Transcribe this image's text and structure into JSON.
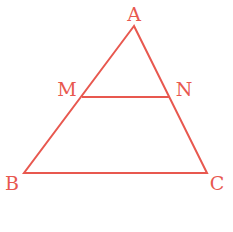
{
  "diagram": {
    "stroke_color": "#e8584f",
    "points": {
      "A": {
        "label": "A",
        "x": 134,
        "y": 26,
        "label_x": 134,
        "label_y": 21
      },
      "B": {
        "label": "B",
        "x": 24,
        "y": 173,
        "label_x": 12,
        "label_y": 190
      },
      "C": {
        "label": "C",
        "x": 207,
        "y": 173,
        "label_x": 217,
        "label_y": 190
      },
      "M": {
        "label": "M",
        "x": 82,
        "y": 97,
        "label_x": 67,
        "label_y": 96
      },
      "N": {
        "label": "N",
        "x": 169,
        "y": 97,
        "label_x": 184,
        "label_y": 96
      }
    },
    "segments": [
      "AB",
      "BC",
      "CA",
      "MN"
    ]
  }
}
